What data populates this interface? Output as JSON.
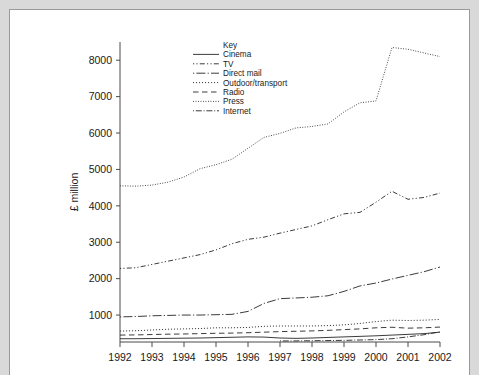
{
  "figure": {
    "background_color": "#ffffff",
    "page_background_color": "#d9d9d9",
    "frame_color": "#9a9a9a",
    "ink_color": "#262626"
  },
  "legend": {
    "title": "Key",
    "entries": [
      {
        "label": "Cinema",
        "style": "solid",
        "dash": "none"
      },
      {
        "label": "TV",
        "style": "dash-dot-dot",
        "dash": "1.2,2.2,1.2,2.2,5,2.2"
      },
      {
        "label": "Direct mail",
        "style": "dash-dot",
        "dash": "1.2,2.2,9,2.2"
      },
      {
        "label": "Outdoor/transport",
        "style": "dotted-fine",
        "dash": "1.1,1.9"
      },
      {
        "label": "Radio",
        "style": "long-dash",
        "dash": "5.5,3.5"
      },
      {
        "label": "Press",
        "style": "dotted-fine",
        "dash": "0.9,1.6"
      },
      {
        "label": "Internet",
        "style": "dash-dot",
        "dash": "1.0,1.8,6,1.8"
      }
    ]
  },
  "chart_data": {
    "type": "line",
    "title": "",
    "xlabel": "",
    "ylabel": "£ million",
    "xlim": [
      1992,
      2002
    ],
    "ylim": [
      260,
      8500
    ],
    "grid": false,
    "legend_position": "top-center-inside",
    "yticks": [
      1000,
      2000,
      3000,
      4000,
      5000,
      6000,
      7000,
      8000
    ],
    "ytick_labels": [
      "1000",
      "2000",
      "3000",
      "4000",
      "5000",
      "6000",
      "7000",
      "8000"
    ],
    "xticks": [
      1992,
      1993,
      1994,
      1995,
      1996,
      1997,
      1998,
      1999,
      2000,
      2001,
      2002
    ],
    "xtick_labels": [
      "1992",
      "1993",
      "1994",
      "1995",
      "1996",
      "1997",
      "1998",
      "1999",
      "2000",
      "2001",
      "2002"
    ],
    "x": [
      1992,
      1992.5,
      1993,
      1993.5,
      1994,
      1994.5,
      1995,
      1995.5,
      1996,
      1996.5,
      1997,
      1997.5,
      1998,
      1998.5,
      1999,
      1999.5,
      2000,
      2000.5,
      2001,
      2001.5,
      2002
    ],
    "series": [
      {
        "name": "Press",
        "values": [
          4550,
          4540,
          4570,
          4650,
          4790,
          5020,
          5130,
          5280,
          5580,
          5880,
          5990,
          6140,
          6180,
          6250,
          6580,
          6830,
          6880,
          8350,
          8300,
          8200,
          8100
        ]
      },
      {
        "name": "TV",
        "values": [
          2280,
          2300,
          2390,
          2480,
          2570,
          2660,
          2790,
          2960,
          3080,
          3140,
          3250,
          3350,
          3450,
          3620,
          3780,
          3820,
          4100,
          4400,
          4180,
          4230,
          4350
        ]
      },
      {
        "name": "Direct mail",
        "values": [
          950,
          960,
          980,
          990,
          1000,
          1000,
          1010,
          1020,
          1100,
          1320,
          1450,
          1470,
          1490,
          1530,
          1650,
          1800,
          1880,
          1990,
          2090,
          2190,
          2320
        ]
      },
      {
        "name": "Outdoor/transport",
        "values": [
          560,
          570,
          590,
          610,
          620,
          630,
          650,
          650,
          660,
          690,
          700,
          700,
          700,
          710,
          730,
          770,
          820,
          860,
          850,
          860,
          880
        ]
      },
      {
        "name": "Radio",
        "values": [
          450,
          455,
          465,
          475,
          480,
          490,
          500,
          505,
          515,
          530,
          545,
          555,
          565,
          580,
          600,
          620,
          650,
          665,
          640,
          650,
          670
        ]
      },
      {
        "name": "Cinema",
        "values": [
          350,
          350,
          355,
          360,
          365,
          370,
          380,
          390,
          400,
          395,
          370,
          360,
          370,
          385,
          400,
          415,
          430,
          450,
          470,
          490,
          530
        ]
      },
      {
        "name": "Internet",
        "values": [
          null,
          null,
          null,
          null,
          null,
          null,
          null,
          null,
          null,
          null,
          290,
          290,
          295,
          300,
          305,
          315,
          325,
          350,
          400,
          460,
          540
        ]
      }
    ]
  }
}
